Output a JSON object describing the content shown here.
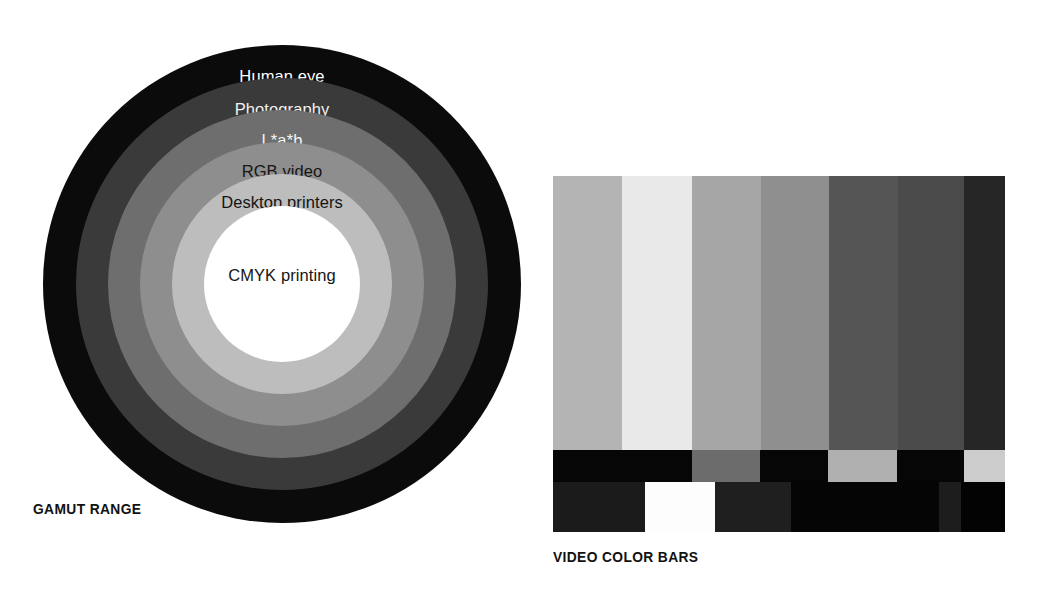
{
  "figures": {
    "gamut": {
      "caption": "GAMUT RANGE",
      "center": {
        "x": 282,
        "y": 284
      },
      "rings": [
        {
          "label": "Human eye",
          "radius": 239,
          "fill": "#0b0b0b",
          "text_color": "#ffffff",
          "label_y": 22
        },
        {
          "label": "Photography",
          "radius": 206,
          "fill": "#3a3a3a",
          "text_color": "#f2f2f2",
          "label_y": 54
        },
        {
          "label": "L*a*b",
          "radius": 174,
          "fill": "#6e6e6e",
          "text_color": "#f4f4f4",
          "label_y": 86
        },
        {
          "label": "RGB video",
          "radius": 142,
          "fill": "#8e8e8e",
          "text_color": "#151515",
          "label_y": 118
        },
        {
          "label": "Desktop printers",
          "radius": 110,
          "fill": "#bdbdbd",
          "text_color": "#141414",
          "label_y": 150
        },
        {
          "label": "CMYK printing",
          "radius": 78,
          "fill": "#ffffff",
          "text_color": "#151515",
          "label_y": 198
        }
      ]
    },
    "colorbars": {
      "caption": "VIDEO COLOR BARS",
      "columns": 7,
      "main_row": {
        "height": 274,
        "bars": [
          {
            "name": "gray-75",
            "fill": "#b4b4b4",
            "width": 69
          },
          {
            "name": "white-bar",
            "fill": "#e9e9e9",
            "width": 70
          },
          {
            "name": "cyan-gray",
            "fill": "#a6a6a6",
            "width": 69
          },
          {
            "name": "green-gray",
            "fill": "#8f8f8f",
            "width": 68
          },
          {
            "name": "magenta-gray",
            "fill": "#555555",
            "width": 69
          },
          {
            "name": "red-gray",
            "fill": "#4b4b4b",
            "width": 66
          },
          {
            "name": "blue-gray",
            "fill": "#262626",
            "width": 41
          }
        ]
      },
      "mid_row": {
        "height": 32,
        "bars": [
          {
            "name": "mid-black-1",
            "fill": "#060606",
            "width": 139
          },
          {
            "name": "mid-gray-1",
            "fill": "#6c6c6c",
            "width": 68
          },
          {
            "name": "mid-black-2",
            "fill": "#060606",
            "width": 68
          },
          {
            "name": "mid-gray-2",
            "fill": "#b0b0b0",
            "width": 69
          },
          {
            "name": "mid-black-3",
            "fill": "#060606",
            "width": 67
          },
          {
            "name": "mid-gray-3",
            "fill": "#cccccc",
            "width": 41
          }
        ]
      },
      "bottom_row": {
        "height": 50,
        "bars": [
          {
            "name": "bottom-darkgray-1",
            "fill": "#1b1b1b",
            "width": 92
          },
          {
            "name": "bottom-white",
            "fill": "#fdfdfd",
            "width": 70
          },
          {
            "name": "bottom-darkgray-2",
            "fill": "#1f1f1f",
            "width": 76
          },
          {
            "name": "bottom-black-1",
            "fill": "#050505",
            "width": 148
          },
          {
            "name": "bottom-darkgray-3",
            "fill": "#1d1d1d",
            "width": 22
          },
          {
            "name": "bottom-black-2",
            "fill": "#030303",
            "width": 44
          }
        ]
      }
    }
  }
}
